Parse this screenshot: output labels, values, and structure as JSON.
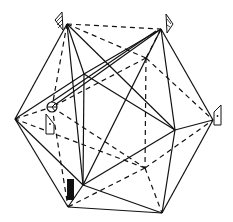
{
  "figure": {
    "width": 233,
    "height": 222,
    "stroke_color": "#111111",
    "background": "#ffffff",
    "vertices": {
      "top_left": [
        67,
        24
      ],
      "top_right": [
        161,
        29
      ],
      "left": [
        15,
        119
      ],
      "right": [
        213,
        120
      ],
      "bottom": [
        68,
        207
      ],
      "bottom_right": [
        162,
        213
      ],
      "inner_upper": [
        84,
        74
      ],
      "inner_right": [
        175,
        130
      ],
      "inner_lower": [
        83,
        185
      ],
      "hidden_left": [
        52,
        107
      ],
      "hidden_top": [
        146,
        58
      ],
      "hidden_bottom": [
        145,
        168
      ]
    },
    "markers": [
      {
        "name": "hatched-flag-top-left",
        "type": "hatched-flag",
        "anchor": "top_left"
      },
      {
        "name": "hatched-flag-top-right",
        "type": "hatched-flag",
        "anchor": "top_right"
      },
      {
        "name": "dot-tag-right",
        "type": "dot-tag",
        "anchor": "right"
      },
      {
        "name": "dot-tag-left",
        "type": "dot-tag",
        "anchor": "hidden_left"
      },
      {
        "name": "crossed-circle",
        "type": "crossed-circle",
        "anchor": "hidden_left"
      },
      {
        "name": "black-bar",
        "type": "solid-bar",
        "anchor": "bottom"
      }
    ]
  }
}
